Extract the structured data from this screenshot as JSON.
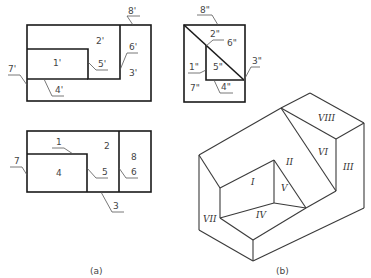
{
  "figure": {
    "caption_a": "(a)",
    "caption_b": "(b)"
  },
  "front_view": {
    "labels": {
      "p1": "1'",
      "p2": "2'",
      "p3": "3'",
      "p4": "4'",
      "p5": "5'",
      "p6": "6'",
      "p7": "7'",
      "p8": "8'"
    }
  },
  "side_view": {
    "labels": {
      "p1": "1\"",
      "p2": "2\"",
      "p3": "3\"",
      "p4": "4\"",
      "p5": "5\"",
      "p6": "6\"",
      "p7": "7\"",
      "p8": "8\""
    }
  },
  "top_view": {
    "labels": {
      "p1": "1",
      "p2": "2",
      "p3": "3",
      "p4": "4",
      "p5": "5",
      "p6": "6",
      "p7": "7",
      "p8": "8"
    }
  },
  "isometric": {
    "faces": {
      "f1": "I",
      "f2": "II",
      "f3": "III",
      "f4": "IV",
      "f5": "V",
      "f6": "VI",
      "f7": "VII",
      "f8": "VIII"
    }
  }
}
